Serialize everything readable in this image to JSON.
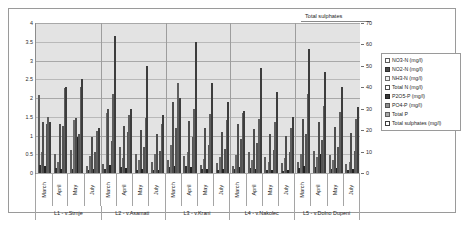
{
  "chart_data": {
    "type": "bar",
    "title": "",
    "annotation": "Total sulphates",
    "xlabel": "",
    "ylabel": "",
    "ylim": [
      0,
      4
    ],
    "y2lim": [
      0,
      70
    ],
    "grid": true,
    "legend_position": "right",
    "y_ticks": [
      "0",
      "0.5",
      "1",
      "1.5",
      "2",
      "2.5",
      "3",
      "3.5",
      "4"
    ],
    "y2_ticks": [
      "0",
      "10",
      "20",
      "30",
      "40",
      "50",
      "60",
      "70"
    ],
    "groups": [
      {
        "label": "L1 - v.Strnje"
      },
      {
        "label": "L2 - v.Asamati"
      },
      {
        "label": "L3 - v.Krani"
      },
      {
        "label": "L4 - v.Nakolec"
      },
      {
        "label": "L5 - v.Dolno Dupeni"
      }
    ],
    "categories": [
      "March",
      "April",
      "May",
      "July",
      "March",
      "April",
      "May",
      "July",
      "March",
      "April",
      "May",
      "July",
      "March",
      "April",
      "May",
      "July",
      "March",
      "April",
      "May",
      "July"
    ],
    "series": [
      {
        "name": "NO3-N (mg/l)",
        "axis": "left",
        "values": [
          2.08,
          0.52,
          0.62,
          0.18,
          0.25,
          0.7,
          0.5,
          0.3,
          0.35,
          0.45,
          0.22,
          0.28,
          0.2,
          0.55,
          0.42,
          0.26,
          0.3,
          0.6,
          0.48,
          0.24
        ]
      },
      {
        "name": "NO2-N (mg/l)",
        "axis": "left",
        "values": [
          0.22,
          0.14,
          0.1,
          0.08,
          0.12,
          0.16,
          0.09,
          0.07,
          0.15,
          0.18,
          0.11,
          0.09,
          0.1,
          0.13,
          0.08,
          0.06,
          0.14,
          0.17,
          0.1,
          0.08
        ]
      },
      {
        "name": "NH3-N (mg/l)",
        "axis": "left",
        "values": [
          0.55,
          0.3,
          1.42,
          0.45,
          1.6,
          0.4,
          0.35,
          0.5,
          0.75,
          0.55,
          0.38,
          0.42,
          0.48,
          0.35,
          0.3,
          0.4,
          0.52,
          0.44,
          0.36,
          0.3
        ]
      },
      {
        "name": "Total N (mg/l)",
        "axis": "left",
        "values": [
          1.35,
          1.3,
          1.48,
          0.95,
          1.7,
          1.25,
          1.15,
          1.05,
          1.9,
          1.4,
          1.2,
          1.1,
          1.3,
          1.18,
          1.05,
          0.98,
          1.45,
          1.35,
          1.22,
          1.08
        ]
      },
      {
        "name": "P2O5-P (mg/l)",
        "axis": "left",
        "values": [
          0.18,
          0.12,
          0.95,
          0.1,
          0.22,
          0.14,
          0.11,
          0.09,
          0.2,
          0.16,
          0.12,
          0.1,
          0.15,
          0.12,
          0.09,
          0.08,
          0.19,
          0.5,
          0.13,
          0.1
        ]
      },
      {
        "name": "PO4-P (mg/l)",
        "axis": "left",
        "values": [
          1.3,
          1.25,
          1.05,
          0.55,
          0.85,
          1.1,
          0.7,
          0.6,
          1.2,
          0.95,
          0.75,
          0.65,
          0.9,
          0.8,
          0.62,
          0.55,
          1.05,
          0.88,
          0.7,
          0.58
        ]
      },
      {
        "name": "Total P",
        "axis": "left",
        "values": [
          1.5,
          2.28,
          2.3,
          1.12,
          2.12,
          1.55,
          1.48,
          1.3,
          2.4,
          1.7,
          1.58,
          1.42,
          1.6,
          1.45,
          1.35,
          1.2,
          2.12,
          1.8,
          1.62,
          1.45
        ]
      },
      {
        "name": "Total sulphates (mg/l)",
        "axis": "right",
        "values": [
          24,
          40,
          44,
          21,
          64,
          30,
          50,
          27,
          35,
          61,
          42,
          33,
          29,
          49,
          38,
          26,
          58,
          47,
          40,
          31
        ]
      }
    ]
  }
}
